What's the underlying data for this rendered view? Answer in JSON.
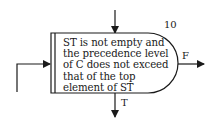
{
  "node": {
    "number": "10",
    "text_lines": [
      "ST is not empty and",
      "the precedence level",
      "of C does not exceed",
      "that of the top",
      "element of ST"
    ]
  },
  "branches": {
    "false_label": "F",
    "true_label": "T"
  },
  "colors": {
    "stroke": "#1a1a1a",
    "background": "#ffffff"
  }
}
